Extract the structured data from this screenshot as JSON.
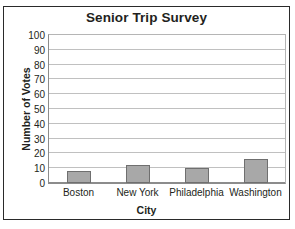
{
  "chart_data": {
    "type": "bar",
    "title": "Senior Trip Survey",
    "xlabel": "City",
    "ylabel": "Number of Votes",
    "categories": [
      "Boston",
      "New York",
      "Philadelphia",
      "Washington"
    ],
    "values": [
      8,
      12,
      10,
      16
    ],
    "ylim": [
      0,
      100
    ],
    "ytick_step": 10,
    "yticks": [
      0,
      10,
      20,
      30,
      40,
      50,
      60,
      70,
      80,
      90,
      100
    ],
    "ytick_labels": [
      "0",
      "10",
      "20",
      "30",
      "40",
      "50",
      "60",
      "70",
      "80",
      "90",
      "100"
    ],
    "grid": true,
    "grid_axis": "y",
    "legend": false,
    "legend_position": "none",
    "bar_color": "#a8a8a8",
    "bar_border_color": "#6f6f6f",
    "gridline_color": "#c0c0c0",
    "axis_color": "#8c8c8c",
    "text_color": "#231f20",
    "frame_color": "#2a2a2a",
    "background": "#ffffff"
  }
}
